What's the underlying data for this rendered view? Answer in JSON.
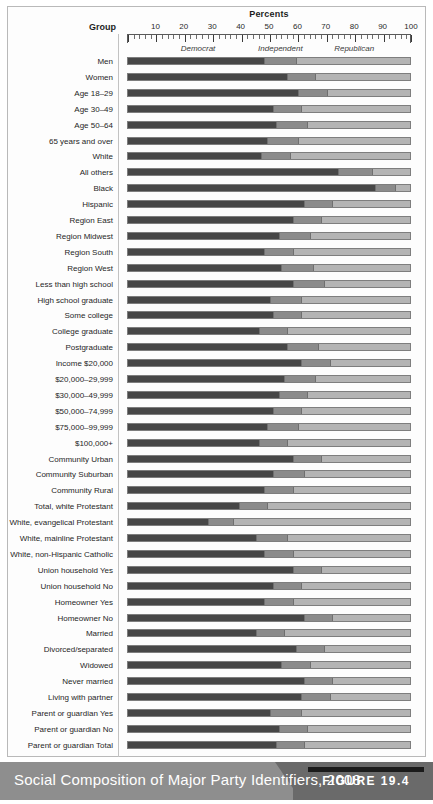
{
  "figure": {
    "caption": "Social Composition of Major Party Identifiers, 2008",
    "figure_number": "FIGURE 19.4"
  },
  "header": {
    "percents_title": "Percents",
    "group_title": "Group"
  },
  "colors": {
    "democrat": "#474747",
    "independent": "#8b8b8b",
    "republican": "#b4b4b4",
    "caption_bar": "#8e8e8e",
    "caption_bar_dark": "#6a6a6a"
  },
  "chart_data": {
    "type": "bar",
    "orientation": "horizontal",
    "stacked": true,
    "title": "Social Composition of Major Party Identifiers, 2008",
    "xlabel": "Percents",
    "ylabel": "Group",
    "xlim": [
      0,
      100
    ],
    "xticks": [
      10,
      20,
      30,
      40,
      50,
      60,
      70,
      80,
      90,
      100
    ],
    "minor_tick_step": 2,
    "grid": false,
    "legend_position": "above-plot-inline",
    "series": [
      {
        "name": "Democrat",
        "color": "#474747"
      },
      {
        "name": "Independent",
        "color": "#8b8b8b"
      },
      {
        "name": "Republican",
        "color": "#b4b4b4"
      }
    ],
    "categories": [
      "Men",
      "Women",
      "Age 18–29",
      "Age 30–49",
      "Age 50–64",
      "65 years and over",
      "White",
      "All others",
      "Black",
      "Hispanic",
      "Region East",
      "Region Midwest",
      "Region South",
      "Region West",
      "Less than high school",
      "High school graduate",
      "Some college",
      "College graduate",
      "Postgraduate",
      "Income $20,000",
      "$20,000–29,999",
      "$30,000–49,999",
      "$50,000–74,999",
      "$75,000–99,999",
      "$100,000+",
      "Community Urban",
      "Community Suburban",
      "Community Rural",
      "Total, white Protestant",
      "White, evangelical Protestant",
      "White, mainline Protestant",
      "White, non-Hispanic Catholic",
      "Union household Yes",
      "Union household No",
      "Homeowner Yes",
      "Homeowner No",
      "Married",
      "Divorced/separated",
      "Widowed",
      "Never married",
      "Living with partner",
      "Parent or guardian Yes",
      "Parent or guardian No",
      "Parent or guardian Total"
    ],
    "values": [
      {
        "category": "Men",
        "democrat": 48,
        "independent": 11,
        "republican": 41
      },
      {
        "category": "Women",
        "democrat": 56,
        "independent": 10,
        "republican": 34
      },
      {
        "category": "Age 18–29",
        "democrat": 60,
        "independent": 10,
        "republican": 30
      },
      {
        "category": "Age 30–49",
        "democrat": 51,
        "independent": 10,
        "republican": 39
      },
      {
        "category": "Age 50–64",
        "democrat": 52,
        "independent": 11,
        "republican": 37
      },
      {
        "category": "65 years and over",
        "democrat": 49,
        "independent": 11,
        "republican": 40
      },
      {
        "category": "White",
        "democrat": 47,
        "independent": 10,
        "republican": 43
      },
      {
        "category": "All others",
        "democrat": 74,
        "independent": 12,
        "republican": 14
      },
      {
        "category": "Black",
        "democrat": 87,
        "independent": 7,
        "republican": 6
      },
      {
        "category": "Hispanic",
        "democrat": 62,
        "independent": 10,
        "republican": 28
      },
      {
        "category": "Region East",
        "democrat": 58,
        "independent": 10,
        "republican": 32
      },
      {
        "category": "Region Midwest",
        "democrat": 53,
        "independent": 11,
        "republican": 36
      },
      {
        "category": "Region South",
        "democrat": 48,
        "independent": 10,
        "republican": 42
      },
      {
        "category": "Region West",
        "democrat": 54,
        "independent": 11,
        "republican": 35
      },
      {
        "category": "Less than high school",
        "democrat": 58,
        "independent": 11,
        "republican": 31
      },
      {
        "category": "High school graduate",
        "democrat": 50,
        "independent": 11,
        "republican": 39
      },
      {
        "category": "Some college",
        "democrat": 51,
        "independent": 10,
        "republican": 39
      },
      {
        "category": "College graduate",
        "democrat": 46,
        "independent": 10,
        "republican": 44
      },
      {
        "category": "Postgraduate",
        "democrat": 56,
        "independent": 11,
        "republican": 33
      },
      {
        "category": "Income $20,000",
        "democrat": 61,
        "independent": 10,
        "republican": 29
      },
      {
        "category": "$20,000–29,999",
        "democrat": 55,
        "independent": 11,
        "republican": 34
      },
      {
        "category": "$30,000–49,999",
        "democrat": 53,
        "independent": 10,
        "republican": 37
      },
      {
        "category": "$50,000–74,999",
        "democrat": 51,
        "independent": 10,
        "republican": 39
      },
      {
        "category": "$75,000–99,999",
        "democrat": 49,
        "independent": 11,
        "republican": 40
      },
      {
        "category": "$100,000+",
        "democrat": 46,
        "independent": 10,
        "republican": 44
      },
      {
        "category": "Community Urban",
        "democrat": 58,
        "independent": 10,
        "republican": 32
      },
      {
        "category": "Community Suburban",
        "democrat": 51,
        "independent": 11,
        "republican": 38
      },
      {
        "category": "Community Rural",
        "democrat": 48,
        "independent": 10,
        "republican": 42
      },
      {
        "category": "Total, white Protestant",
        "democrat": 39,
        "independent": 10,
        "republican": 51
      },
      {
        "category": "White, evangelical Protestant",
        "democrat": 28,
        "independent": 9,
        "republican": 63
      },
      {
        "category": "White, mainline Protestant",
        "democrat": 45,
        "independent": 11,
        "republican": 44
      },
      {
        "category": "White, non-Hispanic Catholic",
        "democrat": 48,
        "independent": 10,
        "republican": 42
      },
      {
        "category": "Union household Yes",
        "democrat": 58,
        "independent": 10,
        "republican": 32
      },
      {
        "category": "Union household No",
        "democrat": 51,
        "independent": 10,
        "republican": 39
      },
      {
        "category": "Homeowner Yes",
        "democrat": 48,
        "independent": 10,
        "republican": 42
      },
      {
        "category": "Homeowner No",
        "democrat": 62,
        "independent": 10,
        "republican": 28
      },
      {
        "category": "Married",
        "democrat": 45,
        "independent": 10,
        "republican": 45
      },
      {
        "category": "Divorced/separated",
        "democrat": 59,
        "independent": 10,
        "republican": 31
      },
      {
        "category": "Widowed",
        "democrat": 54,
        "independent": 10,
        "republican": 36
      },
      {
        "category": "Never married",
        "democrat": 62,
        "independent": 10,
        "republican": 28
      },
      {
        "category": "Living with partner",
        "democrat": 61,
        "independent": 10,
        "republican": 29
      },
      {
        "category": "Parent or guardian Yes",
        "democrat": 50,
        "independent": 11,
        "republican": 39
      },
      {
        "category": "Parent or guardian No",
        "democrat": 53,
        "independent": 10,
        "republican": 37
      },
      {
        "category": "Parent or guardian Total",
        "democrat": 52,
        "independent": 10,
        "republican": 38
      }
    ],
    "segment_labels": [
      {
        "text": "Democrat",
        "at_percent": 25
      },
      {
        "text": "Independent",
        "at_percent": 54
      },
      {
        "text": "Republican",
        "at_percent": 80
      }
    ]
  }
}
